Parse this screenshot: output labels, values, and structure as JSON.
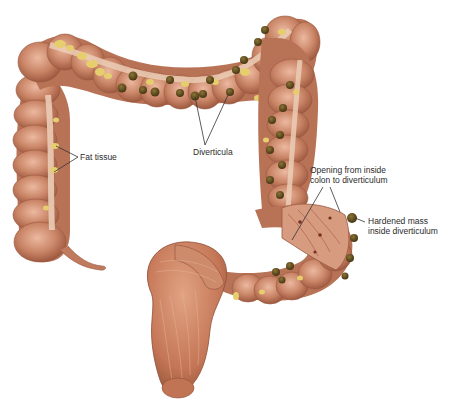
{
  "diagram": {
    "labels": {
      "diverticula": "Diverticula",
      "fat_tissue": "Fat tissue",
      "opening_line1": "Opening from inside",
      "opening_line2": "colon to diverticulum",
      "hardened_line1": "Hardened mass",
      "hardened_line2": "inside diverticulum"
    },
    "colors": {
      "colon_base": "#c98466",
      "colon_shadow": "#a35f45",
      "colon_highlight": "#e8b39a",
      "taenia_band": "#e9c9b3",
      "fat": "#e6cd6e",
      "diverticulum": "#5e4a1e",
      "rectum": "#c47656",
      "pointer_line": "#333333"
    }
  }
}
